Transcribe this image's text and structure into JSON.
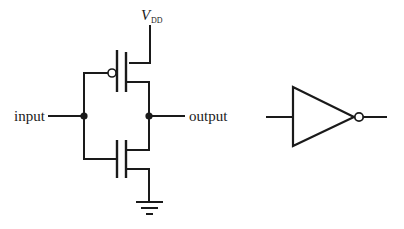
{
  "diagram": {
    "schematic": {
      "labels": {
        "input": "input",
        "output": "output",
        "supply_main": "V",
        "supply_sub": "DD"
      },
      "components": [
        {
          "id": "pmos",
          "type": "PMOS transistor",
          "position": "top",
          "gate_bubble": true
        },
        {
          "id": "nmos",
          "type": "NMOS transistor",
          "position": "bottom",
          "gate_bubble": false
        },
        {
          "id": "vdd",
          "type": "supply rail"
        },
        {
          "id": "gnd",
          "type": "ground"
        }
      ],
      "nodes": [
        "input junction",
        "output junction"
      ]
    },
    "symbol": {
      "type": "NOT gate (inverter)",
      "output_bubble": true
    },
    "colors": {
      "line": "#1a1a1a",
      "background": "#ffffff"
    }
  }
}
